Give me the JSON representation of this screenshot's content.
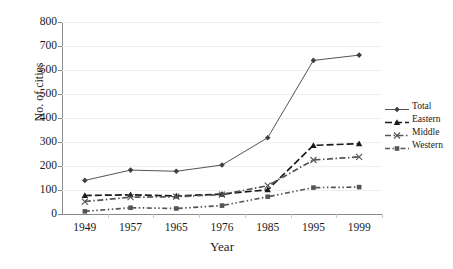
{
  "chart_data": {
    "type": "line",
    "title": "",
    "xlabel": "Year",
    "ylabel": "No. of cities",
    "categories": [
      "1949",
      "1957",
      "1965",
      "1976",
      "1985",
      "1995",
      "1999"
    ],
    "ylim": [
      0,
      800
    ],
    "ytick_values": [
      0,
      100,
      200,
      300,
      400,
      500,
      600,
      700,
      800
    ],
    "ytick_labels": [
      "0",
      "100",
      "200",
      "300",
      "400",
      "500",
      "600",
      "700",
      "800"
    ],
    "grid": true,
    "legend_position": "right",
    "series": [
      {
        "name": "Total",
        "marker": "diamond",
        "line_style": "solid",
        "color": "#404040",
        "values": [
          140,
          183,
          178,
          204,
          318,
          640,
          662
        ]
      },
      {
        "name": "Eastern",
        "marker": "triangle",
        "line_style": "dashed",
        "color": "#1a1a1a",
        "values": [
          77,
          80,
          75,
          83,
          101,
          286,
          293
        ]
      },
      {
        "name": "Middle",
        "marker": "cross",
        "line_style": "dash-dot",
        "color": "#555555",
        "values": [
          52,
          70,
          72,
          81,
          118,
          225,
          238
        ]
      },
      {
        "name": "Western",
        "marker": "square",
        "line_style": "dash-dot-dot",
        "color": "#555555",
        "values": [
          11,
          26,
          23,
          35,
          72,
          110,
          112
        ]
      }
    ]
  },
  "legend": {
    "entries": [
      {
        "label": "Total"
      },
      {
        "label": "Eastern"
      },
      {
        "label": "Middle"
      },
      {
        "label": "Western"
      }
    ]
  }
}
